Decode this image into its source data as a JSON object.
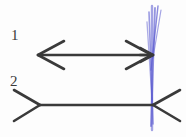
{
  "figure": {
    "background_color": "#fdfdfd",
    "ink_color": "#3a3a3a",
    "accent_color": "#5a5ad0",
    "labels": [
      {
        "id": "label-1",
        "text": "1",
        "x": 11,
        "y": 28
      },
      {
        "id": "label-2",
        "text": "2",
        "x": 10,
        "y": 74
      }
    ],
    "shapes": {
      "line1": {
        "name": "arrow-line-1",
        "description": "horizontal shaft with inward arrowheads at both ends",
        "shaft": {
          "x1": 38,
          "y1": 55,
          "x2": 152,
          "y2": 55
        },
        "left_head": [
          {
            "x1": 38,
            "y1": 55,
            "x2": 64,
            "y2": 41
          },
          {
            "x1": 38,
            "y1": 55,
            "x2": 64,
            "y2": 69
          }
        ],
        "right_head": [
          {
            "x1": 152,
            "y1": 55,
            "x2": 126,
            "y2": 41
          },
          {
            "x1": 152,
            "y1": 55,
            "x2": 126,
            "y2": 69
          }
        ]
      },
      "line2": {
        "name": "fin-line-2",
        "description": "horizontal shaft with outward fins at both ends",
        "shaft": {
          "x1": 40,
          "y1": 105,
          "x2": 153,
          "y2": 105
        },
        "left_fin": [
          {
            "x1": 40,
            "y1": 105,
            "x2": 14,
            "y2": 90
          },
          {
            "x1": 40,
            "y1": 105,
            "x2": 14,
            "y2": 121
          }
        ],
        "right_fin": [
          {
            "x1": 153,
            "y1": 105,
            "x2": 180,
            "y2": 90
          },
          {
            "x1": 153,
            "y1": 105,
            "x2": 180,
            "y2": 121
          }
        ]
      },
      "blue_marker": {
        "name": "blue-vertical-reference-line",
        "description": "vertical blue pen stroke drawn several times at the right endpoints",
        "color": "#5a5ad0",
        "strokes": [
          {
            "x1": 152,
            "y1": 6,
            "x2": 152,
            "y2": 130
          },
          {
            "x1": 155,
            "y1": 8,
            "x2": 151,
            "y2": 126
          },
          {
            "x1": 149,
            "y1": 12,
            "x2": 153,
            "y2": 124
          },
          {
            "x1": 158,
            "y1": 6,
            "x2": 151,
            "y2": 70
          },
          {
            "x1": 161,
            "y1": 10,
            "x2": 153,
            "y2": 58
          },
          {
            "x1": 147,
            "y1": 22,
            "x2": 152,
            "y2": 100
          }
        ]
      }
    }
  }
}
